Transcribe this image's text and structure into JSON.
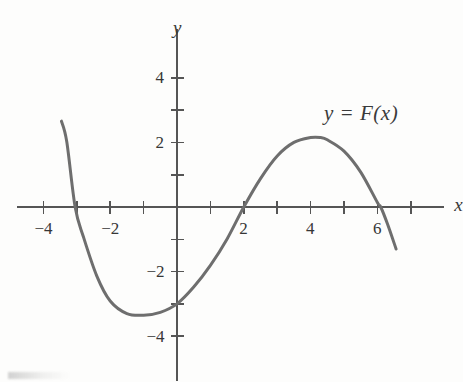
{
  "figure": {
    "background_color": "#fdfdfc",
    "curve_color": "#6e6e6e",
    "axis_color": "#555555",
    "text_color": "#363636"
  },
  "labels": {
    "curve": "y = F(x)",
    "axis_x": "x",
    "axis_y": "y"
  },
  "chart_data": {
    "type": "line",
    "title": "",
    "subtitle": "",
    "xlabel": "x",
    "ylabel": "y",
    "annotations": [
      {
        "text": "y = F(x)",
        "x": 5.0,
        "y": 2.9
      }
    ],
    "legend": [],
    "legend_position": "none",
    "grid": false,
    "axes": {
      "style": "cartesian-centered",
      "origin_px": [
        177,
        207
      ],
      "x_unit_px": 33.4,
      "y_unit_px": 32.3,
      "xlim": [
        -4.8,
        8.0
      ],
      "ylim": [
        -5.4,
        5.5
      ],
      "x_tick_step": 1,
      "y_tick_step": 1,
      "x_ticks": [
        -4,
        -3,
        -2,
        -1,
        1,
        2,
        3,
        4,
        5,
        6,
        7
      ],
      "y_ticks": [
        -4,
        -3,
        -2,
        -1,
        1,
        2,
        3,
        4
      ],
      "x_tick_labels": [
        {
          "value": -4,
          "text": "−4"
        },
        {
          "value": -2,
          "text": "−2"
        },
        {
          "value": 2,
          "text": "2"
        },
        {
          "value": 4,
          "text": "4"
        },
        {
          "value": 6,
          "text": "6"
        }
      ],
      "y_tick_labels": [
        {
          "value": 4,
          "text": "4"
        },
        {
          "value": 2,
          "text": "2"
        },
        {
          "value": -2,
          "text": "−2"
        },
        {
          "value": -4,
          "text": "−4"
        }
      ]
    },
    "series": [
      {
        "name": "y = F(x)",
        "color": "#6e6e6e",
        "linewidth": 3.0,
        "x_domain": [
          -3.46,
          6.56
        ],
        "roots": [
          -3.05,
          2.0,
          6.1
        ],
        "y_intercept": -3.0,
        "local_minimum": {
          "x": -1.0,
          "y": -3.35
        },
        "local_maximum": {
          "x": 4.3,
          "y": 2.15
        },
        "equation": "F(x) = -0.0806 (x + 3.05)(x - 2)(x - 6.1)",
        "coefficients": {
          "a": -0.0806,
          "r1": -3.05,
          "r2": 2.0,
          "r3": 6.1
        },
        "points": [
          {
            "x": -3.46,
            "y": 2.66
          },
          {
            "x": -3.3,
            "y": 2.02
          },
          {
            "x": -3.05,
            "y": 0.0
          },
          {
            "x": -2.8,
            "y": -0.93
          },
          {
            "x": -2.4,
            "y": -2.14
          },
          {
            "x": -2.0,
            "y": -2.91
          },
          {
            "x": -1.5,
            "y": -3.3
          },
          {
            "x": -1.0,
            "y": -3.35
          },
          {
            "x": -0.5,
            "y": -3.26
          },
          {
            "x": 0.0,
            "y": -3.0
          },
          {
            "x": 0.5,
            "y": -2.48
          },
          {
            "x": 1.0,
            "y": -1.81
          },
          {
            "x": 1.5,
            "y": -0.99
          },
          {
            "x": 2.0,
            "y": 0.0
          },
          {
            "x": 2.5,
            "y": 0.88
          },
          {
            "x": 3.0,
            "y": 1.58
          },
          {
            "x": 3.5,
            "y": 2.0
          },
          {
            "x": 4.0,
            "y": 2.15
          },
          {
            "x": 4.3,
            "y": 2.15
          },
          {
            "x": 4.5,
            "y": 2.08
          },
          {
            "x": 5.0,
            "y": 1.73
          },
          {
            "x": 5.5,
            "y": 1.08
          },
          {
            "x": 6.0,
            "y": 0.14
          },
          {
            "x": 6.1,
            "y": 0.0
          },
          {
            "x": 6.3,
            "y": -0.52
          },
          {
            "x": 6.56,
            "y": -1.3
          }
        ]
      }
    ]
  }
}
